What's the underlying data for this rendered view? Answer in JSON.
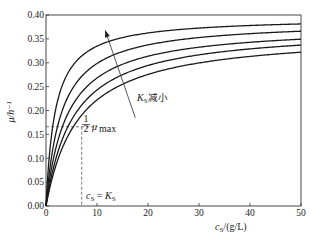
{
  "chart_data": {
    "type": "line",
    "title": "",
    "xlabel": "c_S/(g/L)",
    "ylabel": "μ/h⁻¹",
    "xlim": [
      0,
      50
    ],
    "ylim": [
      0.0,
      0.4
    ],
    "xticks": [
      0,
      10,
      20,
      30,
      40,
      50
    ],
    "yticks": [
      0.0,
      0.05,
      0.1,
      0.15,
      0.2,
      0.25,
      0.3,
      0.35,
      0.4
    ],
    "ytick_labels": [
      "0.00",
      "0.05",
      "0.10",
      "0.15",
      "0.20",
      "0.25",
      "0.30",
      "0.35",
      "0.40"
    ],
    "xtick_labels": [
      "0",
      "10",
      "20",
      "30",
      "40",
      "50"
    ],
    "grid": false,
    "legend": null,
    "model": "Monod: μ = μmax·cS/(KS + cS)",
    "series": [
      {
        "name": "curve 1 (smallest K_S)",
        "mu_max": 0.395,
        "Ks": 1.8,
        "x": [
          0,
          5,
          10,
          20,
          30,
          40,
          50
        ],
        "values": [
          0.0,
          0.291,
          0.335,
          0.363,
          0.373,
          0.378,
          0.381
        ]
      },
      {
        "name": "curve 2",
        "mu_max": 0.388,
        "Ks": 3.0,
        "x": [
          0,
          5,
          10,
          20,
          30,
          40,
          50
        ],
        "values": [
          0.0,
          0.242,
          0.299,
          0.337,
          0.353,
          0.361,
          0.366
        ]
      },
      {
        "name": "curve 3",
        "mu_max": 0.378,
        "Ks": 4.1,
        "x": [
          0,
          5,
          10,
          20,
          30,
          40,
          50
        ],
        "values": [
          0.0,
          0.208,
          0.268,
          0.314,
          0.333,
          0.343,
          0.349
        ]
      },
      {
        "name": "curve 4",
        "mu_max": 0.373,
        "Ks": 5.35,
        "x": [
          0,
          5,
          10,
          20,
          30,
          40,
          50
        ],
        "values": [
          0.0,
          0.18,
          0.243,
          0.294,
          0.317,
          0.329,
          0.337
        ]
      },
      {
        "name": "curve 5 (largest K_S)",
        "mu_max": 0.363,
        "Ks": 6.35,
        "x": [
          0,
          5,
          10,
          20,
          30,
          40,
          50
        ],
        "values": [
          0.0,
          0.16,
          0.222,
          0.276,
          0.3,
          0.313,
          0.322
        ]
      }
    ],
    "annotations": [
      {
        "text": "K_S减小",
        "label_main": "K",
        "label_sub": "S",
        "label_rest": "减小",
        "arrow_from": [
          17.5,
          0.185
        ],
        "arrow_to": [
          11.6,
          0.368
        ]
      },
      {
        "text": "½ μmax",
        "frac_num": "1",
        "frac_den": "2",
        "symbol": "μ",
        "sub": "max",
        "y": 0.166,
        "type": "dashed-hline"
      },
      {
        "text": "c_S = K_S",
        "c": "c",
        "c_sub": "S",
        "eq": " = ",
        "k": "K",
        "k_sub": "S",
        "x": 7,
        "type": "dashed-vline"
      }
    ]
  }
}
